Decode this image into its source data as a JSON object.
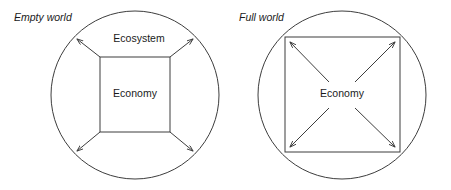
{
  "figure": {
    "background_color": "#ffffff",
    "stroke_color": "#3d3d3d",
    "text_color": "#1a1a1a",
    "width": 451,
    "height": 190
  },
  "panels": [
    {
      "key": "empty_world",
      "title": "Empty world",
      "title_style": "italic",
      "circle": {
        "cx": 135,
        "cy": 95,
        "r": 84,
        "label": "ecosystem-boundary"
      },
      "square": {
        "x": 100,
        "y": 57,
        "width": 70,
        "height": 75,
        "label": "economy-boundary"
      },
      "outer_label": "Ecosystem",
      "outer_label_x": 139,
      "outer_label_y": 42,
      "inner_label": "Economy",
      "inner_label_x": 135,
      "inner_label_y": 97,
      "arrows": [
        {
          "name": "arrow-up-left",
          "x1": 100,
          "y1": 57,
          "x2": 76,
          "y2": 38
        },
        {
          "name": "arrow-up-right",
          "x1": 170,
          "y1": 57,
          "x2": 194,
          "y2": 38
        },
        {
          "name": "arrow-down-left",
          "x1": 100,
          "y1": 132,
          "x2": 76,
          "y2": 152
        },
        {
          "name": "arrow-down-right",
          "x1": 170,
          "y1": 132,
          "x2": 194,
          "y2": 152
        }
      ]
    },
    {
      "key": "full_world",
      "title": "Full world",
      "title_style": "italic",
      "circle": {
        "cx": 342,
        "cy": 95,
        "r": 84,
        "label": "ecosystem-boundary"
      },
      "square": {
        "x": 285,
        "y": 37,
        "width": 115,
        "height": 115,
        "label": "economy-boundary"
      },
      "outer_label": "",
      "inner_label": "Economy",
      "inner_label_x": 342,
      "inner_label_y": 97,
      "arrows": [
        {
          "name": "arrow-up-left",
          "x1": 328,
          "y1": 81,
          "x2": 289,
          "y2": 41
        },
        {
          "name": "arrow-up-right",
          "x1": 356,
          "y1": 81,
          "x2": 396,
          "y2": 41
        },
        {
          "name": "arrow-down-left",
          "x1": 328,
          "y1": 109,
          "x2": 289,
          "y2": 148
        },
        {
          "name": "arrow-down-right",
          "x1": 356,
          "y1": 109,
          "x2": 396,
          "y2": 148
        }
      ]
    }
  ],
  "titles": {
    "left": "Empty world",
    "right": "Full world"
  },
  "labels": {
    "left_outer": "Ecosystem",
    "left_inner": "Economy",
    "right_inner": "Economy"
  },
  "title_positions": {
    "left": {
      "x": 14,
      "y": 21
    },
    "right": {
      "x": 239,
      "y": 21
    }
  }
}
